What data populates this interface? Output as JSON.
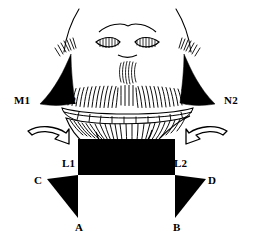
{
  "figure": {
    "type": "anatomical-line-drawing",
    "background_color": "#ffffff",
    "ink_color": "#000000"
  },
  "labels": [
    {
      "id": "M1",
      "text": "M1",
      "x": 14,
      "y": 95,
      "role": "lateral-landmark-left-outer"
    },
    {
      "id": "M2",
      "text": "M2",
      "x": 60,
      "y": 95,
      "role": "lateral-landmark-left-inner"
    },
    {
      "id": "N1",
      "text": "N1",
      "x": 184,
      "y": 93,
      "role": "lateral-landmark-right-inner"
    },
    {
      "id": "N2",
      "text": "N2",
      "x": 224,
      "y": 95,
      "role": "lateral-landmark-right-outer"
    },
    {
      "id": "L1",
      "text": "L1",
      "x": 62,
      "y": 158,
      "role": "lower-landmark-left"
    },
    {
      "id": "L2",
      "text": "L2",
      "x": 174,
      "y": 158,
      "role": "lower-landmark-right"
    },
    {
      "id": "C",
      "text": "C",
      "x": 34,
      "y": 175,
      "role": "lower-flap-left-lateral"
    },
    {
      "id": "D",
      "text": "D",
      "x": 208,
      "y": 175,
      "role": "lower-flap-right-lateral"
    },
    {
      "id": "A",
      "text": "A",
      "x": 75,
      "y": 222,
      "role": "lower-flap-left-apex"
    },
    {
      "id": "B",
      "text": "B",
      "x": 173,
      "y": 222,
      "role": "lower-flap-right-apex"
    }
  ],
  "arrows": [
    {
      "id": "arrow-left",
      "direction": "right",
      "role": "advancement-direction-left"
    },
    {
      "id": "arrow-right",
      "direction": "left",
      "role": "advancement-direction-right"
    }
  ],
  "shapes": {
    "black_wedges": [
      {
        "id": "wedge-upper-left",
        "role": "excision-wedge-left"
      },
      {
        "id": "wedge-upper-right",
        "role": "excision-wedge-right"
      },
      {
        "id": "wedge-lower-left",
        "role": "excision-triangle-left"
      },
      {
        "id": "wedge-lower-right",
        "role": "excision-triangle-right"
      }
    ],
    "black_block": {
      "id": "central-block",
      "role": "chin-resection-block"
    }
  }
}
